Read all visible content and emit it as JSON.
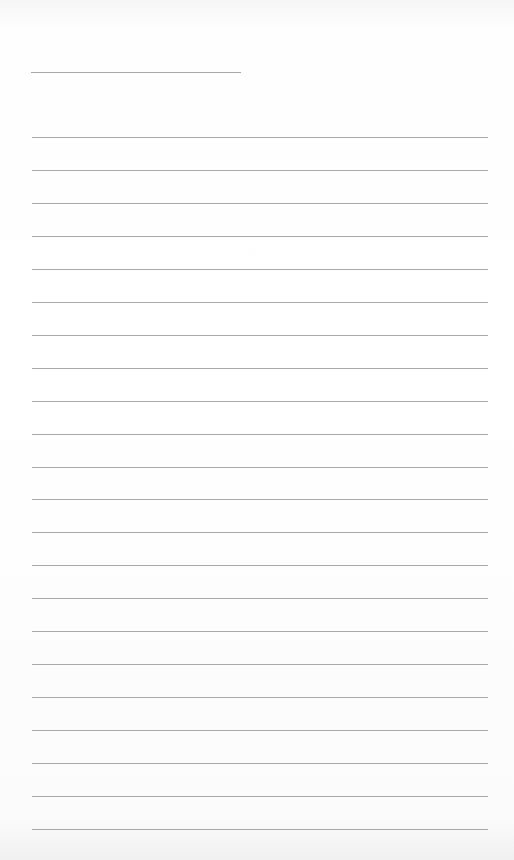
{
  "page": {
    "type": "lined-paper",
    "header_line": {
      "x": 31,
      "y": 72,
      "width": 210
    },
    "lines": {
      "count": 22,
      "start_y": 137,
      "spacing": 32.95,
      "x": 32,
      "width": 456
    },
    "colors": {
      "background": "#fdfdfd",
      "rule": "#9a9a9a"
    }
  }
}
